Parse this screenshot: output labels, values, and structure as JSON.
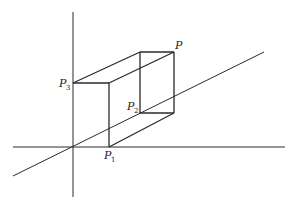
{
  "diagram": {
    "type": "3d-coordinate-box",
    "labels": {
      "P": {
        "text": "P",
        "sub": ""
      },
      "P1": {
        "text": "P",
        "sub": "1"
      },
      "P2": {
        "text": "P",
        "sub": "2"
      },
      "P3": {
        "text": "P",
        "sub": "3"
      }
    }
  }
}
